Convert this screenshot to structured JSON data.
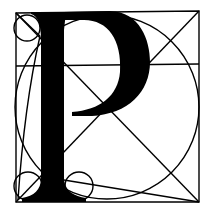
{
  "figure": {
    "letter": "P",
    "colors": {
      "background": "#ffffff",
      "ink": "#000000"
    },
    "frame": {
      "x": 16,
      "y": 12,
      "width": 183,
      "height": 190
    },
    "construction": {
      "midline_y": 65,
      "big_circle": {
        "cx": 107,
        "cy": 107,
        "r": 91
      },
      "small_circles": [
        {
          "name": "top-left",
          "cx": 26,
          "cy": 28,
          "r": 13
        },
        {
          "name": "bottom-left",
          "cx": 28,
          "cy": 186,
          "r": 14
        },
        {
          "name": "bottom-middle",
          "cx": 79,
          "cy": 186,
          "r": 14
        }
      ]
    }
  }
}
